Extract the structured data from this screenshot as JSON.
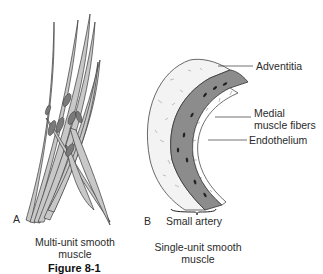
{
  "panels": [
    {
      "letter": "A",
      "caption_line1": "Multi-unit smooth",
      "caption_line2": "muscle"
    },
    {
      "letter": "B",
      "sublabel": "Small artery",
      "caption_line1": "Single-unit smooth",
      "caption_line2": "muscle",
      "annotations": [
        {
          "label": "Adventitia"
        },
        {
          "label_line1": "Medial",
          "label_line2": "muscle fibers"
        },
        {
          "label": "Endothelium"
        }
      ]
    }
  ],
  "figure_caption": "Figure 8-1",
  "colors": {
    "fiber_fill": "#c8c8c8",
    "fiber_stroke": "#3a3a3a",
    "nucleus": "#6a6a6a",
    "media": "#8a8a8a",
    "adventitia": "#f2f2f2"
  }
}
